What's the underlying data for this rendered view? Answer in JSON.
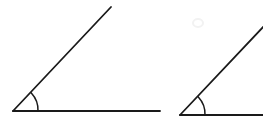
{
  "document": {
    "title": "Two congruent acute angles",
    "background_color": "#ffffff",
    "width": 263,
    "height": 127
  },
  "style": {
    "stroke_color": "#1a1a1a",
    "ray_stroke_width": 1.8,
    "arc_stroke_width": 1.5,
    "faint_color": "#f2f2f2"
  },
  "figures": [
    {
      "name": "left-angle",
      "label": "Angle 1",
      "vertex": {
        "x": 13,
        "y": 111
      },
      "horizontal_ray": {
        "x1": 13,
        "y1": 111,
        "x2": 127,
        "y2": 111
      },
      "diagonal_ray": {
        "x1": 13,
        "y1": 111,
        "x2": 111,
        "y2": 7
      },
      "arc": {
        "radius": 25,
        "start": {
          "x": 38,
          "y": 111
        },
        "end": {
          "x": 31.3,
          "y": 92.9
        },
        "path": "M 38 111 A 25 25 0 0 0 31.3 92.9"
      },
      "angle_degrees": 46
    },
    {
      "name": "right-angle",
      "label": "Angle 2",
      "vertex": {
        "x": 180,
        "y": 115
      },
      "horizontal_ray": {
        "x1": 180,
        "y1": 115,
        "x2": 263,
        "y2": 115
      },
      "diagonal_ray": {
        "x1": 180,
        "y1": 115,
        "x2": 266,
        "y2": 24
      },
      "arc": {
        "radius": 25,
        "start": {
          "x": 205,
          "y": 115
        },
        "end": {
          "x": 198.3,
          "y": 96.9
        },
        "path": "M 205 115 A 25 25 0 0 0 198.3 96.9"
      },
      "angle_degrees": 46
    }
  ],
  "left_tail_segment": {
    "name": "left-figure-line-tail",
    "x1": 127,
    "y1": 111,
    "x2": 160,
    "y2": 111
  },
  "faint_mark": {
    "name": "faint-smudge",
    "cx": 198,
    "cy": 23,
    "rx": 5,
    "ry": 4
  }
}
